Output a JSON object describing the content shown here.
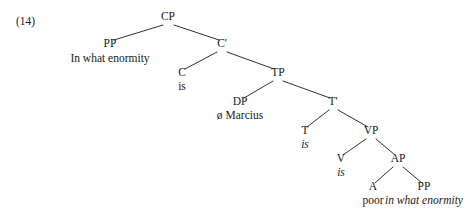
{
  "figure": {
    "example_number": "(14)",
    "background_color": "#ffffff",
    "line_color": "#1a1a1a",
    "text_color": "#1a1a1a"
  },
  "nodes": {
    "cp": {
      "label": "CP",
      "x": 168,
      "y": 20
    },
    "pp_spec": {
      "label": "PP",
      "x": 110,
      "y": 47
    },
    "cbar": {
      "label": "C'",
      "x": 222,
      "y": 47
    },
    "c": {
      "label": "C",
      "x": 182,
      "y": 76
    },
    "tp": {
      "label": "TP",
      "x": 278,
      "y": 76
    },
    "dp": {
      "label": "DP",
      "x": 240,
      "y": 105
    },
    "tbar": {
      "label": "T'",
      "x": 333,
      "y": 105
    },
    "t": {
      "label": "T",
      "x": 305,
      "y": 134
    },
    "vp": {
      "label": "VP",
      "x": 371,
      "y": 134
    },
    "v": {
      "label": "V",
      "x": 341,
      "y": 162
    },
    "ap": {
      "label": "AP",
      "x": 398,
      "y": 162
    },
    "a": {
      "label": "A",
      "x": 373,
      "y": 190
    },
    "pp_comp": {
      "label": "PP",
      "x": 424,
      "y": 190
    }
  },
  "terminals": {
    "pp_spec_text": {
      "text": "In what enormity",
      "x": 110,
      "y": 62,
      "italic": false
    },
    "c_text": {
      "text": "is",
      "x": 182,
      "y": 90,
      "italic": false
    },
    "dp_text": {
      "text": "ø Marcius",
      "x": 240,
      "y": 119,
      "italic": false
    },
    "t_text": {
      "text": "is",
      "x": 305,
      "y": 148,
      "italic": true
    },
    "v_text": {
      "text": "is",
      "x": 341,
      "y": 176,
      "italic": true
    },
    "a_text": {
      "text": "poor",
      "x": 373,
      "y": 204,
      "italic": false
    },
    "pp_comp_text": {
      "text": "in what enormity",
      "x": 424,
      "y": 204,
      "italic": true
    }
  },
  "example_label": {
    "x": 16,
    "y": 25
  }
}
